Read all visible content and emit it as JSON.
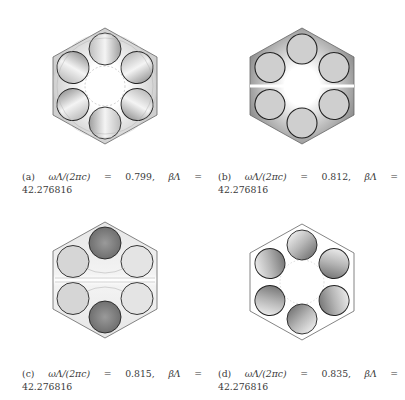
{
  "figure": {
    "panels": [
      {
        "id": "a",
        "label": "(a)",
        "freq_expr": "ωΛ/(2πc)",
        "eq1": "=",
        "freq_value": "0.799,",
        "beta_expr": "βΛ",
        "eq2": "=",
        "beta_value": "42.276816",
        "style": "contour-lines-radial",
        "shading": "light"
      },
      {
        "id": "b",
        "label": "(b)",
        "freq_expr": "ωΛ/(2πc)",
        "eq1": "=",
        "freq_value": "0.812,",
        "beta_expr": "βΛ",
        "eq2": "=",
        "beta_value": "42.276816",
        "style": "filled-gray",
        "shading": "dark"
      },
      {
        "id": "c",
        "label": "(c)",
        "freq_expr": "ωΛ/(2πc)",
        "eq1": "=",
        "freq_value": "0.815,",
        "beta_expr": "βΛ",
        "eq2": "=",
        "beta_value": "42.276816",
        "style": "contour-lines-horizontal",
        "shading": "medium"
      },
      {
        "id": "d",
        "label": "(d)",
        "freq_expr": "ωΛ/(2πc)",
        "eq1": "=",
        "freq_value": "0.835,",
        "beta_expr": "βΛ",
        "eq2": "=",
        "beta_value": "42.276816",
        "style": "contour-lines-radial",
        "shading": "light"
      }
    ],
    "colors": {
      "outline": "#555555",
      "rod_outline": "#222222",
      "fill_dark": "#9a9a9a",
      "fill_light": "#d8d8d8"
    }
  }
}
